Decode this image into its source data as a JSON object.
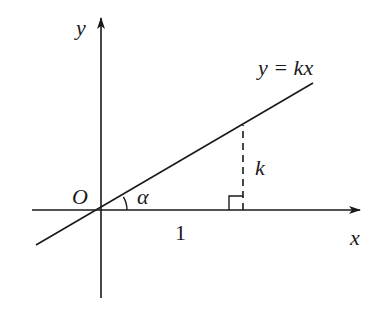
{
  "diagram": {
    "type": "coordinate-geometry",
    "labels": {
      "y_axis": "y",
      "x_axis": "x",
      "origin": "O",
      "line_equation": "y = kx",
      "angle": "α",
      "run": "1",
      "rise": "k"
    },
    "colors": {
      "stroke": "#1a1a1a",
      "background": "#ffffff"
    },
    "elements": {
      "x_axis": {
        "from": [
          32,
          210
        ],
        "to": [
          360,
          210
        ],
        "arrow": true
      },
      "y_axis": {
        "from": [
          101,
          298
        ],
        "to": [
          101,
          18
        ],
        "arrow": true
      },
      "line": {
        "from": [
          36,
          245
        ],
        "to": [
          313,
          83
        ]
      },
      "dashed_rise": {
        "x": 243,
        "from_y": 210,
        "to_y": 127
      },
      "right_angle_marker": {
        "x": 229,
        "y": 196,
        "size": 14
      },
      "angle_arc": {
        "center": [
          101,
          210
        ],
        "radius": 26
      }
    }
  }
}
